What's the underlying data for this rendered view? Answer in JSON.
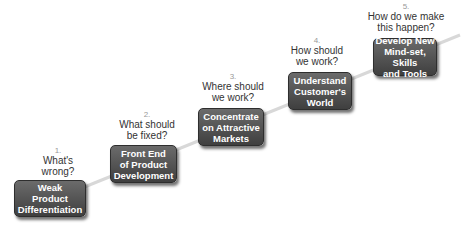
{
  "diagram": {
    "type": "staircase-process",
    "colors": {
      "box": "#555555",
      "box_text": "#ffffff",
      "question_text": "#333333",
      "number_text": "#999999",
      "connector": "#d8d8d8"
    },
    "steps": [
      {
        "number": "1.",
        "question_lines": [
          "What's",
          "wrong?"
        ],
        "box_lines": [
          "Weak",
          "Product",
          "Differentiation"
        ]
      },
      {
        "number": "2.",
        "question_lines": [
          "What should",
          "be fixed?"
        ],
        "box_lines": [
          "Front End",
          "of Product",
          "Development"
        ]
      },
      {
        "number": "3.",
        "question_lines": [
          "Where should",
          "we work?"
        ],
        "box_lines": [
          "Concentrate",
          "on Attractive",
          "Markets"
        ]
      },
      {
        "number": "4.",
        "question_lines": [
          "How should",
          "we work?"
        ],
        "box_lines": [
          "Understand",
          "Customer's",
          "World"
        ]
      },
      {
        "number": "5.",
        "question_lines": [
          "How do we make",
          "this happen?"
        ],
        "box_lines": [
          "Develop New",
          "Mind-set, Skills",
          "and Tools"
        ]
      }
    ]
  }
}
